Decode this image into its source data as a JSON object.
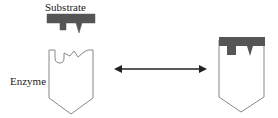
{
  "diagram": {
    "labels": {
      "substrate": "Substrate",
      "enzyme": "Enzyme"
    },
    "colors": {
      "substrate_fill": "#555555",
      "enzyme_stroke": "#888888",
      "arrow": "#222222",
      "text": "#222222"
    },
    "arrow": {
      "type": "double-headed"
    }
  }
}
